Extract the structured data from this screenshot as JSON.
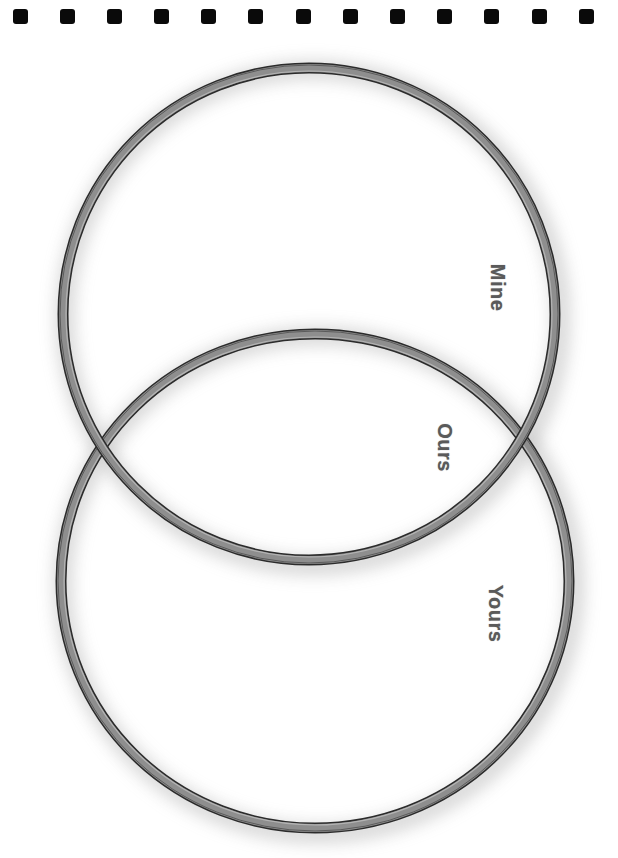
{
  "diagram": {
    "type": "venn",
    "orientation": "rotated-90-clockwise",
    "sets": [
      {
        "id": "mine",
        "label": "Mine",
        "cx": 309,
        "cy": 314,
        "rx": 246,
        "ry": 246
      },
      {
        "id": "yours",
        "label": "Yours",
        "cx": 315,
        "cy": 581,
        "rx": 254,
        "ry": 247
      }
    ],
    "intersection": {
      "label": "Ours"
    }
  },
  "paper": {
    "punch_holes": 13,
    "background": "#ffffff",
    "hole_color": "#0a0a0a"
  },
  "colors": {
    "ring_fill": "#8e8e8e",
    "ring_outline": "#2b2b2b",
    "ring_highlight": "#bdbdbd",
    "shadow": "#9e9e9e",
    "label": "#5a5a5a"
  }
}
